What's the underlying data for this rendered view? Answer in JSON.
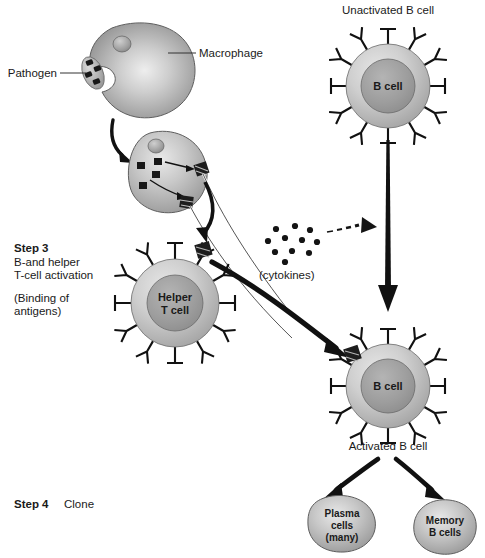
{
  "figure": {
    "background_color": "#ffffff",
    "width": 485,
    "height": 558
  },
  "palette": {
    "ink": "#1a1a1a",
    "outline": "#5e5e5e",
    "cell_light": "#d8d8d8",
    "cell_mid": "#a8a8a8",
    "cell_dark": "#8a8a8a",
    "nucleus": "#9a9a9a",
    "arrow": "#111111"
  },
  "labels": {
    "macrophage": "Macrophage",
    "pathogen": "Pathogen",
    "unactivated_b_cell": "Unactivated B cell",
    "activated_b_cell": "Activated B cell",
    "cytokines": "(cytokines)"
  },
  "steps": [
    {
      "id": "step3",
      "number": "Step 3",
      "lines": [
        "B-and helper",
        "T-cell activation"
      ],
      "parenthetical": [
        "(Binding of",
        "antigens)"
      ]
    },
    {
      "id": "step4",
      "number": "Step 4",
      "caption": "Clone"
    }
  ],
  "cells": {
    "macrophage": {
      "name": "Macrophage",
      "has_nucleus": true
    },
    "apc": {
      "name": "Antigen presenting macrophage",
      "internal_antigens": 3,
      "surface_complexes": 2
    },
    "helper_t_cell": {
      "label_lines": [
        "Helper",
        "T cell"
      ],
      "receptor_count": 12,
      "bound_antigen": true
    },
    "unactivated_b": {
      "label_lines": [
        "B cell"
      ],
      "receptor_count": 12,
      "bound_antigen": false
    },
    "activated_b": {
      "label_lines": [
        "B cell"
      ],
      "receptor_count": 12,
      "bound_antigen": true
    },
    "plasma_cells": {
      "label_lines": [
        "Plasma",
        "cells",
        "(many)"
      ]
    },
    "memory_b_cells": {
      "label_lines": [
        "Memory",
        "B cells"
      ]
    }
  },
  "cytokines": {
    "dot_count": 11,
    "label": "(cytokines)"
  }
}
